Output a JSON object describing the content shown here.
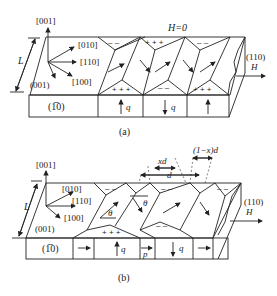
{
  "panel_a": {
    "caption": "(a)",
    "field_label": "H=0",
    "axes": {
      "z": "[001]",
      "y": "[010]",
      "x110": "[110]",
      "x100": "[100]",
      "plane_left": "(001)"
    },
    "thickness_label": "L",
    "front_face_label": "(1̅0)",
    "side_face_label": "(110)",
    "applied_field_label": "H",
    "closure_signs": {
      "plus": "+ + +",
      "minus": "– –"
    },
    "bottom_cells": [
      "q",
      "q"
    ]
  },
  "panel_b": {
    "caption": "(b)",
    "axes": {
      "z": "[001]",
      "y": "[010]",
      "x110": "[110]",
      "x100": "[100]",
      "plane_left": "(001)"
    },
    "thickness_label": "L",
    "front_face_label": "(1̅0)",
    "side_face_label": "(110)",
    "applied_field_label": "H",
    "angle_label": "θ",
    "period_label": "d",
    "fraction_label": "xd",
    "remainder_label": "(1−x)d",
    "bottom_cells": [
      "q",
      "p",
      "q"
    ]
  }
}
